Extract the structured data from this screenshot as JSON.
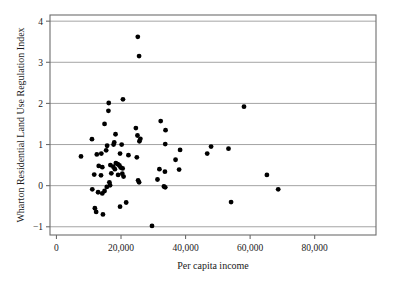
{
  "chart_data": {
    "type": "scatter",
    "title": "",
    "xlabel": "Per capita income",
    "ylabel": "Wharton Residential Land Use Regulation Index",
    "xlim": [
      -2000,
      99000
    ],
    "ylim": [
      -1.2,
      4.15
    ],
    "xticks": [
      0,
      20000,
      40000,
      60000,
      80000
    ],
    "xticklabels": [
      "0",
      "20,000",
      "40,000",
      "60,000",
      "80,000"
    ],
    "yticks": [
      -1,
      0,
      1,
      2,
      3,
      4
    ],
    "yticklabels": [
      "−1",
      "0",
      "1",
      "2",
      "3",
      "4"
    ],
    "grid": "horizontal",
    "legend": "none",
    "marker": "filled-circle",
    "marker_color": "#000000",
    "points": [
      {
        "x": 25200,
        "y": 3.62
      },
      {
        "x": 25600,
        "y": 3.15
      },
      {
        "x": 20600,
        "y": 2.1
      },
      {
        "x": 16200,
        "y": 2.01
      },
      {
        "x": 16100,
        "y": 1.82
      },
      {
        "x": 58100,
        "y": 1.92
      },
      {
        "x": 32300,
        "y": 1.57
      },
      {
        "x": 14900,
        "y": 1.5
      },
      {
        "x": 24600,
        "y": 1.4
      },
      {
        "x": 33800,
        "y": 1.35
      },
      {
        "x": 18300,
        "y": 1.25
      },
      {
        "x": 25100,
        "y": 1.22
      },
      {
        "x": 26000,
        "y": 1.14
      },
      {
        "x": 25700,
        "y": 1.08
      },
      {
        "x": 11000,
        "y": 1.13
      },
      {
        "x": 17900,
        "y": 1.05
      },
      {
        "x": 17700,
        "y": 1.0
      },
      {
        "x": 20200,
        "y": 1.0
      },
      {
        "x": 33700,
        "y": 1.01
      },
      {
        "x": 15700,
        "y": 0.97
      },
      {
        "x": 47900,
        "y": 0.95
      },
      {
        "x": 53300,
        "y": 0.9
      },
      {
        "x": 15400,
        "y": 0.86
      },
      {
        "x": 38300,
        "y": 0.87
      },
      {
        "x": 12500,
        "y": 0.76
      },
      {
        "x": 13900,
        "y": 0.78
      },
      {
        "x": 46700,
        "y": 0.78
      },
      {
        "x": 19700,
        "y": 0.78
      },
      {
        "x": 22300,
        "y": 0.74
      },
      {
        "x": 24900,
        "y": 0.69
      },
      {
        "x": 7600,
        "y": 0.71
      },
      {
        "x": 36900,
        "y": 0.63
      },
      {
        "x": 18400,
        "y": 0.55
      },
      {
        "x": 19000,
        "y": 0.52
      },
      {
        "x": 19500,
        "y": 0.49
      },
      {
        "x": 16700,
        "y": 0.5
      },
      {
        "x": 13100,
        "y": 0.48
      },
      {
        "x": 14200,
        "y": 0.45
      },
      {
        "x": 19900,
        "y": 0.44
      },
      {
        "x": 20500,
        "y": 0.42
      },
      {
        "x": 17600,
        "y": 0.46
      },
      {
        "x": 18100,
        "y": 0.4
      },
      {
        "x": 31900,
        "y": 0.4
      },
      {
        "x": 33600,
        "y": 0.34
      },
      {
        "x": 38000,
        "y": 0.39
      },
      {
        "x": 20400,
        "y": 0.29
      },
      {
        "x": 11700,
        "y": 0.27
      },
      {
        "x": 20800,
        "y": 0.22
      },
      {
        "x": 17000,
        "y": 0.3
      },
      {
        "x": 13800,
        "y": 0.25
      },
      {
        "x": 19100,
        "y": 0.26
      },
      {
        "x": 65200,
        "y": 0.26
      },
      {
        "x": 31300,
        "y": 0.15
      },
      {
        "x": 25300,
        "y": 0.13
      },
      {
        "x": 25600,
        "y": 0.08
      },
      {
        "x": 16400,
        "y": 0.08
      },
      {
        "x": 16600,
        "y": 0.01
      },
      {
        "x": 15600,
        "y": -0.03
      },
      {
        "x": 33300,
        "y": -0.02
      },
      {
        "x": 33700,
        "y": -0.04
      },
      {
        "x": 11100,
        "y": -0.09
      },
      {
        "x": 14900,
        "y": -0.13
      },
      {
        "x": 12900,
        "y": -0.16
      },
      {
        "x": 14200,
        "y": -0.19
      },
      {
        "x": 68700,
        "y": -0.09
      },
      {
        "x": 54100,
        "y": -0.4
      },
      {
        "x": 21600,
        "y": -0.41
      },
      {
        "x": 19700,
        "y": -0.51
      },
      {
        "x": 11900,
        "y": -0.55
      },
      {
        "x": 12300,
        "y": -0.64
      },
      {
        "x": 14400,
        "y": -0.7
      },
      {
        "x": 29600,
        "y": -0.98
      }
    ]
  }
}
